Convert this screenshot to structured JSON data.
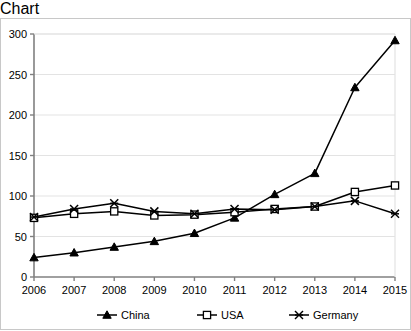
{
  "chart_data": {
    "type": "line",
    "title": "",
    "subtitle": "",
    "xlabel": "",
    "ylabel": "",
    "categories": [
      "2006",
      "2007",
      "2008",
      "2009",
      "2010",
      "2011",
      "2012",
      "2013",
      "2014",
      "2015"
    ],
    "x": [
      2006,
      2007,
      2008,
      2009,
      2010,
      2011,
      2012,
      2013,
      2014,
      2015
    ],
    "xlim": [
      2006,
      2015
    ],
    "ylim": [
      0,
      300
    ],
    "yticks": [
      0,
      50,
      100,
      150,
      200,
      250,
      300
    ],
    "ytick_labels": [
      "0",
      "50",
      "100",
      "150",
      "200",
      "250",
      "300"
    ],
    "xtick_labels": [
      "2006",
      "2007",
      "2008",
      "2009",
      "2010",
      "2011",
      "2012",
      "2013",
      "2014",
      "2015"
    ],
    "grid": "horizontal",
    "grid_color": "#e3e3e3",
    "axis_color": "#808080",
    "legend_position": "bottom",
    "series": [
      {
        "name": "China",
        "marker": "filled-triangle",
        "color": "#000000",
        "values": [
          24,
          30,
          37,
          44,
          54,
          73,
          102,
          128,
          234,
          292
        ]
      },
      {
        "name": "USA",
        "marker": "open-square",
        "color": "#000000",
        "values": [
          73,
          78,
          81,
          76,
          77,
          80,
          84,
          87,
          105,
          113
        ]
      },
      {
        "name": "Germany",
        "marker": "cross-x",
        "color": "#000000",
        "values": [
          74,
          84,
          91,
          81,
          78,
          84,
          83,
          87,
          94,
          78
        ]
      }
    ]
  },
  "legend": {
    "items": [
      {
        "label": "China"
      },
      {
        "label": "USA"
      },
      {
        "label": "Germany"
      }
    ]
  }
}
